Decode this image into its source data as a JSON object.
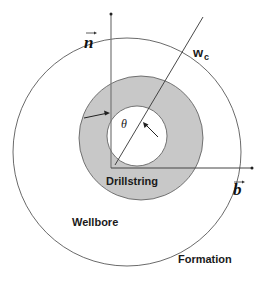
{
  "diagram": {
    "labels": {
      "n_vector": "n",
      "b_vector": "b",
      "wc": "w",
      "wc_sub": "c",
      "theta": "θ",
      "drillstring": "Drillstring",
      "wellbore": "Wellbore",
      "formation": "Formation"
    },
    "colors": {
      "annulus_fill": "#c8c8c8",
      "stroke": "#333333",
      "background": "#ffffff"
    }
  }
}
